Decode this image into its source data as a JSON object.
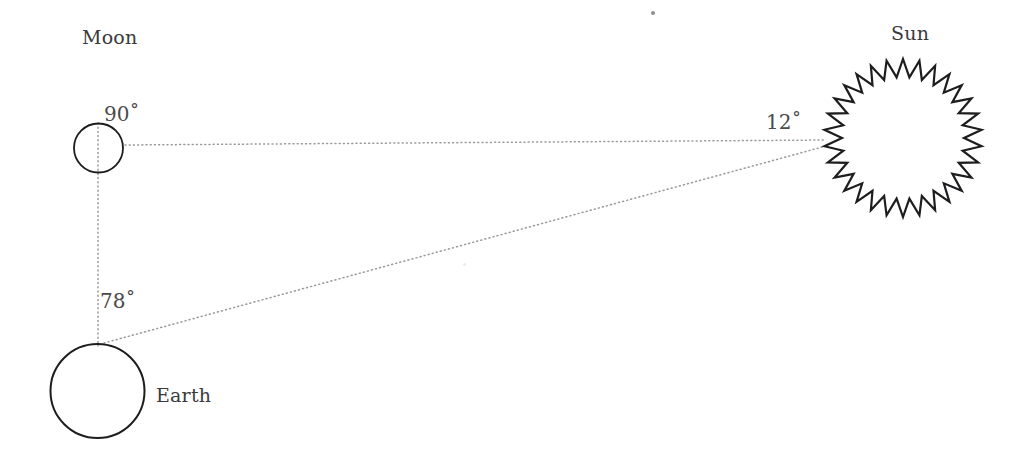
{
  "diagram": {
    "background_color": "#ffffff",
    "stroke_color": "#1d1d1f",
    "dotted_color": "#9a9a9c",
    "text_color": "#3a3a3c",
    "labels": {
      "moon": "Moon",
      "sun": "Sun",
      "earth": "Earth"
    },
    "angles": {
      "at_moon": "90˚",
      "at_earth": "78˚",
      "at_sun": "12˚"
    },
    "bodies": [
      {
        "name": "moon",
        "shape": "circle",
        "cx": 98.5,
        "cy": 148,
        "r": 24.5,
        "stroke_width": 1.8,
        "fill": "none"
      },
      {
        "name": "earth",
        "shape": "circle",
        "cx": 97.5,
        "cy": 391,
        "r": 47,
        "stroke_width": 2.0,
        "fill": "none"
      },
      {
        "name": "sun",
        "shape": "star",
        "cx": 903,
        "cy": 138,
        "outer_r": 79,
        "inner_r": 61,
        "spikes": 30,
        "stroke_width": 2.2,
        "fill": "none"
      }
    ],
    "sight_lines": [
      {
        "name": "moon-to-sun-line",
        "style": "dotted",
        "x1": 125,
        "y1": 145,
        "x2": 826,
        "y2": 140
      },
      {
        "name": "earth-to-sun-line",
        "style": "dotted",
        "x1": 104,
        "y1": 343,
        "x2": 826,
        "y2": 146
      },
      {
        "name": "earth-to-moon-line",
        "style": "dotted",
        "x1": 98,
        "y1": 123,
        "x2": 98,
        "y2": 346
      }
    ],
    "specks": [
      {
        "name": "top-speck",
        "x": 651,
        "y": 11,
        "size": 4
      },
      {
        "name": "mid-speck",
        "x": 463,
        "y": 263,
        "size": 3
      }
    ]
  }
}
